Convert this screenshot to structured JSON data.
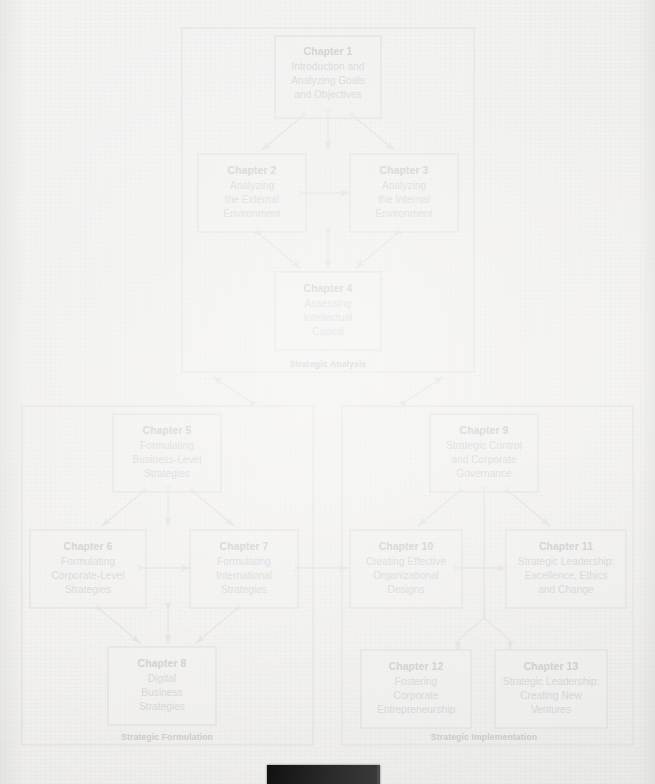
{
  "diagram": {
    "type": "hierarchy-flow",
    "panels": [
      {
        "id": "analysis",
        "label": "Strategic Analysis"
      },
      {
        "id": "formulation",
        "label": "Strategic Formulation"
      },
      {
        "id": "implementation",
        "label": "Strategic Implementation"
      }
    ],
    "boxes": [
      {
        "id": "ch1",
        "panel": "analysis",
        "title": "Chapter 1",
        "lines": [
          "Introduction and",
          "Analyzing Goals",
          "and Objectives"
        ]
      },
      {
        "id": "ch2",
        "panel": "analysis",
        "title": "Chapter 2",
        "lines": [
          "Analyzing",
          "the External",
          "Environment"
        ]
      },
      {
        "id": "ch3",
        "panel": "analysis",
        "title": "Chapter 3",
        "lines": [
          "Analyzing",
          "the Internal",
          "Environment"
        ]
      },
      {
        "id": "ch4",
        "panel": "analysis",
        "title": "Chapter 4",
        "lines": [
          "Assessing",
          "Intellectual",
          "Capital"
        ]
      },
      {
        "id": "ch5",
        "panel": "formulation",
        "title": "Chapter 5",
        "lines": [
          "Formulating",
          "Business-Level",
          "Strategies"
        ]
      },
      {
        "id": "ch6",
        "panel": "formulation",
        "title": "Chapter 6",
        "lines": [
          "Formulating",
          "Corporate-Level",
          "Strategies"
        ]
      },
      {
        "id": "ch7",
        "panel": "formulation",
        "title": "Chapter 7",
        "lines": [
          "Formulating",
          "International",
          "Strategies"
        ]
      },
      {
        "id": "ch8",
        "panel": "formulation",
        "title": "Chapter 8",
        "lines": [
          "Digital",
          "Business",
          "Strategies"
        ]
      },
      {
        "id": "ch9",
        "panel": "implementation",
        "title": "Chapter 9",
        "lines": [
          "Strategic Control",
          "and Corporate",
          "Governance"
        ]
      },
      {
        "id": "ch10",
        "panel": "implementation",
        "title": "Chapter 10",
        "lines": [
          "Creating Effective",
          "Organizational",
          "Designs"
        ]
      },
      {
        "id": "ch11",
        "panel": "implementation",
        "title": "Chapter 11",
        "lines": [
          "Strategic Leadership:",
          "Excellence, Ethics",
          "and Change"
        ]
      },
      {
        "id": "ch12",
        "panel": "implementation",
        "title": "Chapter 12",
        "lines": [
          "Fostering",
          "Corporate",
          "Entrepreneurship"
        ]
      },
      {
        "id": "ch13",
        "panel": "implementation",
        "title": "Chapter 13",
        "lines": [
          "Strategic Leadership:",
          "Creating New",
          "Ventures"
        ]
      }
    ],
    "colors": {
      "page_background": "#efefed",
      "panel_border": "#dcdcda",
      "box_border": "#dadad7",
      "box_fill": "#f0f0ee",
      "title_text": "#c9c9c7",
      "body_text": "#d2d2d0",
      "panel_label_text": "#c6c6c4",
      "connector": "#dedede",
      "bottom_bar": "#1a1a1a"
    }
  }
}
